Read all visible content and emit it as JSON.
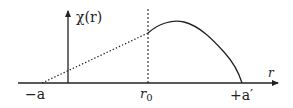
{
  "diagram": {
    "y_label": "χ(r)",
    "x_label": "r",
    "ticks": {
      "left": "−a",
      "mid": "r",
      "mid_sub": "0",
      "right": "+a′"
    }
  },
  "colors": {
    "stroke": "#222222",
    "background": "#ffffff"
  }
}
